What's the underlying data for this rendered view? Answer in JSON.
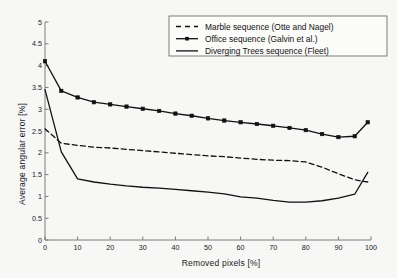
{
  "chart_data": {
    "type": "line",
    "title": "",
    "xlabel": "Removed pixels [%]",
    "ylabel": "Average angular error [%]",
    "xlim": [
      0,
      100
    ],
    "ylim": [
      0,
      5
    ],
    "xticks": [
      0,
      10,
      20,
      30,
      40,
      50,
      60,
      70,
      80,
      90,
      100
    ],
    "yticks": [
      0,
      0.5,
      1,
      1.5,
      2,
      2.5,
      3,
      3.5,
      4,
      4.5,
      5
    ],
    "xtick_labels": [
      "0",
      "10",
      "20",
      "30",
      "40",
      "50",
      "60",
      "70",
      "80",
      "90",
      "100"
    ],
    "ytick_labels": [
      "0",
      "0.5",
      "1",
      "1.5",
      "2",
      "2.5",
      "3",
      "3.5",
      "4",
      "4.5",
      "5"
    ],
    "grid": false,
    "legend_position": "top-right",
    "line_color": "#111111",
    "background_color": "#f7f7f6",
    "series": [
      {
        "name": "Marble sequence (Otte and Nagel)",
        "style": "dashed",
        "marker": "none",
        "x": [
          0,
          5,
          10,
          15,
          20,
          25,
          30,
          35,
          40,
          45,
          50,
          55,
          60,
          65,
          70,
          75,
          80,
          85,
          90,
          95,
          99
        ],
        "values": [
          2.55,
          2.22,
          2.17,
          2.13,
          2.11,
          2.08,
          2.05,
          2.02,
          1.99,
          1.96,
          1.93,
          1.91,
          1.88,
          1.85,
          1.83,
          1.82,
          1.79,
          1.67,
          1.52,
          1.38,
          1.33
        ]
      },
      {
        "name": "Office sequence (Galvin et al.)",
        "style": "solid",
        "marker": "square",
        "x": [
          0,
          5,
          10,
          15,
          20,
          25,
          30,
          35,
          40,
          45,
          50,
          55,
          60,
          65,
          70,
          75,
          80,
          85,
          90,
          95,
          99
        ],
        "values": [
          4.1,
          3.42,
          3.27,
          3.16,
          3.11,
          3.06,
          3.01,
          2.96,
          2.9,
          2.85,
          2.79,
          2.74,
          2.7,
          2.66,
          2.62,
          2.57,
          2.52,
          2.43,
          2.36,
          2.38,
          2.7
        ]
      },
      {
        "name": "Diverging Trees sequence (Fleet)",
        "style": "solid",
        "marker": "none",
        "x": [
          0,
          5,
          10,
          15,
          20,
          25,
          30,
          35,
          40,
          45,
          50,
          55,
          60,
          65,
          70,
          75,
          80,
          85,
          90,
          95,
          99
        ],
        "values": [
          3.45,
          2.02,
          1.4,
          1.33,
          1.28,
          1.24,
          1.21,
          1.19,
          1.16,
          1.13,
          1.1,
          1.06,
          0.99,
          0.96,
          0.91,
          0.87,
          0.87,
          0.9,
          0.96,
          1.05,
          1.55
        ]
      }
    ]
  },
  "legend": {
    "entries": [
      "Marble sequence (Otte and Nagel)",
      "Office sequence (Galvin et al.)",
      "Diverging Trees sequence (Fleet)"
    ]
  }
}
